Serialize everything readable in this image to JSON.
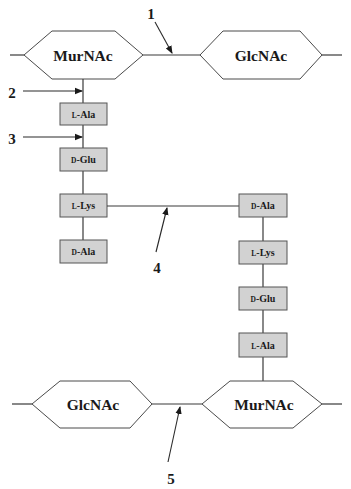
{
  "diagram": {
    "type": "peptidoglycan-crosslink-schematic",
    "top_glycan_chain": {
      "left_sugar": "MurNAc",
      "right_sugar": "GlcNAc"
    },
    "bottom_glycan_chain": {
      "left_sugar": "GlcNAc",
      "right_sugar": "MurNAc"
    },
    "left_stem_peptide": [
      {
        "stereo": "L",
        "residue": "-Ala"
      },
      {
        "stereo": "D",
        "residue": "-Glu"
      },
      {
        "stereo": "L",
        "residue": "-Lys"
      },
      {
        "stereo": "D",
        "residue": "-Ala"
      }
    ],
    "right_stem_peptide": [
      {
        "stereo": "D",
        "residue": "-Ala"
      },
      {
        "stereo": "L",
        "residue": "-Lys"
      },
      {
        "stereo": "D",
        "residue": "-Glu"
      },
      {
        "stereo": "L",
        "residue": "-Ala"
      }
    ],
    "markers": {
      "m1": "1",
      "m2": "2",
      "m3": "3",
      "m4": "4",
      "m5": "5"
    },
    "colors": {
      "box_fill": "#d2d2d2",
      "box_stroke": "#555555",
      "hex_fill": "#ffffff",
      "line": "#3a3a3a",
      "text": "#1a1a1a"
    }
  }
}
